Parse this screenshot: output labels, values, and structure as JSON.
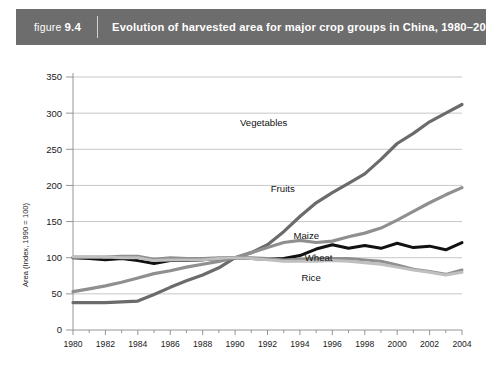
{
  "header": {
    "figure_word": "figure",
    "figure_number": "9.4",
    "title": "Evolution of harvested area for major crop groups in China, 1980–2004",
    "bar_color": "#6d6d6d"
  },
  "chart_data": {
    "type": "line",
    "title": "Evolution of harvested area for major crop groups in China, 1980–2004",
    "xlabel": "",
    "ylabel": "Area (Index, 1990 = 100)",
    "xlim": [
      1980,
      2004
    ],
    "ylim": [
      0,
      350
    ],
    "ytick_values": [
      0,
      50,
      100,
      150,
      200,
      250,
      300,
      350
    ],
    "ytick_labels": [
      "0",
      "50",
      "100",
      "150",
      "200",
      "250",
      "300",
      "350"
    ],
    "xtick_values": [
      1980,
      1982,
      1984,
      1986,
      1988,
      1990,
      1992,
      1994,
      1996,
      1998,
      2000,
      2002,
      2004
    ],
    "xtick_labels": [
      "1980",
      "1982",
      "1984",
      "1986",
      "1988",
      "1990",
      "1992",
      "1994",
      "1996",
      "1998",
      "2000",
      "2002",
      "2004"
    ],
    "xtick_minor_values": [
      1981,
      1983,
      1985,
      1987,
      1989,
      1991,
      1993,
      1995,
      1997,
      1999,
      2001,
      2003
    ],
    "grid": true,
    "legend_position": "inline-right",
    "x": [
      1980,
      1981,
      1982,
      1983,
      1984,
      1985,
      1986,
      1987,
      1988,
      1989,
      1990,
      1991,
      1992,
      1993,
      1994,
      1995,
      1996,
      1997,
      1998,
      1999,
      2000,
      2001,
      2002,
      2003,
      2004
    ],
    "series": [
      {
        "name": "Vegetables",
        "color": "#6b6b6b",
        "width": 3.2,
        "label_x": 1990.3,
        "label_y": 287,
        "values": [
          38,
          38,
          38,
          39,
          40,
          49,
          59,
          68,
          76,
          86,
          100,
          107,
          118,
          136,
          157,
          176,
          190,
          203,
          216,
          236,
          258,
          272,
          288,
          300,
          312
        ]
      },
      {
        "name": "Fruits",
        "color": "#8f8f8f",
        "width": 3.2,
        "label_x": 1992.2,
        "label_y": 196,
        "values": [
          53,
          57,
          61,
          66,
          72,
          78,
          82,
          87,
          91,
          95,
          100,
          107,
          114,
          121,
          124,
          121,
          123,
          129,
          134,
          141,
          152,
          164,
          176,
          187,
          197
        ]
      },
      {
        "name": "Maize",
        "color": "#111111",
        "width": 3.0,
        "label_x": 1993.6,
        "label_y": 131,
        "values": [
          100,
          99,
          97,
          99,
          96,
          92,
          96,
          96,
          97,
          99,
          100,
          99,
          98,
          99,
          103,
          112,
          118,
          113,
          117,
          113,
          120,
          114,
          116,
          111,
          121
        ]
      },
      {
        "name": "Wheat",
        "color": "#8f8f8f",
        "width": 3.0,
        "label_x": 1994.3,
        "label_y": 100,
        "values": [
          101,
          101,
          101,
          102,
          102,
          98,
          100,
          99,
          99,
          100,
          100,
          100,
          99,
          97,
          98,
          99,
          99,
          99,
          97,
          95,
          90,
          84,
          81,
          77,
          83
        ]
      },
      {
        "name": "Rice",
        "color": "#bfbfbf",
        "width": 3.0,
        "label_x": 1994.1,
        "label_y": 72,
        "values": [
          101,
          101,
          101,
          100,
          100,
          96,
          97,
          97,
          97,
          99,
          100,
          99,
          97,
          95,
          95,
          95,
          96,
          95,
          93,
          91,
          87,
          83,
          80,
          76,
          80
        ]
      }
    ]
  }
}
